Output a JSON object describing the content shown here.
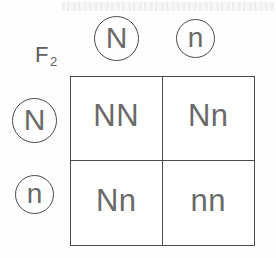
{
  "diagram": {
    "generation_label": "F",
    "generation_subscript": "2",
    "column_headers": [
      {
        "allele": "N",
        "size": "big"
      },
      {
        "allele": "n",
        "size": "small"
      }
    ],
    "row_headers": [
      {
        "allele": "N",
        "size": "big"
      },
      {
        "allele": "n",
        "size": "small"
      }
    ],
    "cells": [
      {
        "genotype": "NN"
      },
      {
        "genotype": "Nn"
      },
      {
        "genotype": "Nn"
      },
      {
        "genotype": "nn"
      }
    ],
    "colors": {
      "stroke": "#4a4a4a",
      "text": "#6a6a6a",
      "background": "#fefefe"
    }
  }
}
